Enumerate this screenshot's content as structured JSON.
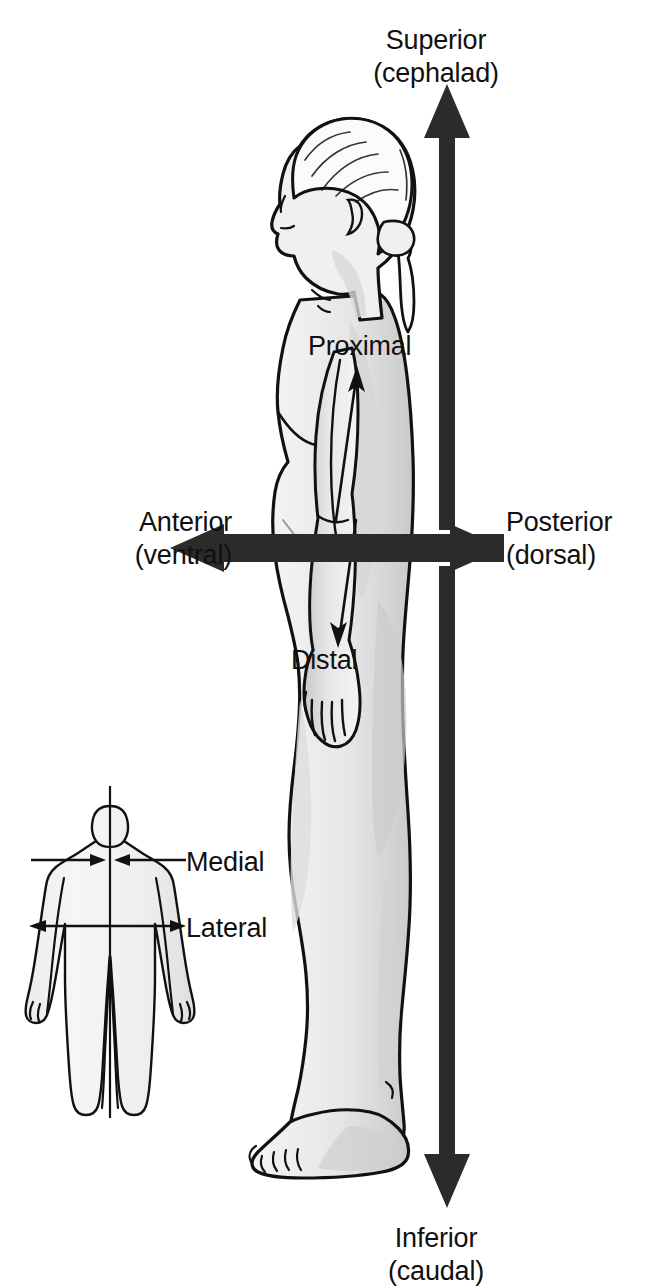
{
  "figure": {
    "title_visible": false,
    "background_color": "#ffffff",
    "ink_color": "#101010",
    "body_fill": "#f1f1f1",
    "body_shade": "#cfcfcf",
    "outline_color": "#111111"
  },
  "labels": {
    "superior": {
      "primary": "Superior",
      "secondary": "(cephalad)"
    },
    "inferior": {
      "primary": "Inferior",
      "secondary": "(caudal)"
    },
    "anterior": {
      "primary": "Anterior",
      "secondary": "(ventral)"
    },
    "posterior": {
      "primary": "Posterior",
      "secondary": "(dorsal)"
    },
    "proximal": {
      "primary": "Proximal"
    },
    "distal": {
      "primary": "Distal"
    },
    "medial": {
      "primary": "Medial"
    },
    "lateral": {
      "primary": "Lateral"
    }
  },
  "arrows": {
    "vertical_axis": {
      "name": "superior-inferior-axis",
      "direction": "bidirectional-vertical",
      "style": "thick-solid-block",
      "color": "#2b2b2b",
      "top_tip_y": 84,
      "bottom_tip_y": 1208,
      "shaft_x": 437,
      "shaft_width": 21
    },
    "horizontal_axis": {
      "name": "anterior-posterior-axis",
      "direction": "bidirectional-horizontal",
      "style": "thick-solid-block",
      "color": "#2b2b2b",
      "left_tip_x": 170,
      "right_tip_x": 504,
      "shaft_y": 541,
      "shaft_height": 19
    },
    "proximal_arrow": {
      "name": "proximal-arrow",
      "direction": "up-along-arm",
      "style": "thin-line",
      "tip": [
        357,
        368
      ],
      "tail": [
        335,
        518
      ]
    },
    "distal_arrow": {
      "name": "distal-arrow",
      "direction": "down-along-arm",
      "style": "thin-line",
      "tip": [
        338,
        645
      ],
      "tail": [
        356,
        520
      ]
    },
    "medial_arrows": {
      "name": "medial-arrow-pair",
      "direction": "inward-toward-midline",
      "style": "thin-line",
      "y": 860,
      "left_tail_x": 31,
      "left_tip_x": 105,
      "right_tail_x": 185,
      "right_tip_x": 113,
      "leader_to_label_x": 186
    },
    "lateral_arrows": {
      "name": "lateral-arrow-pair",
      "direction": "outward-from-midline",
      "style": "thin-line",
      "y": 926,
      "left_tip_x": 29,
      "right_tip_x": 185,
      "leader_to_label_x": 186
    }
  },
  "figures": {
    "main": {
      "name": "lateral-view-female-body",
      "view": "lateral (side) profile, facing left",
      "features": [
        "head with ponytail",
        "arm with elbow",
        "hand at hip",
        "leg",
        "foot with toes"
      ]
    },
    "inset": {
      "name": "anterior-view-body-inset",
      "view": "anterior (front) view",
      "midline": {
        "x": 110,
        "top_y": 786,
        "bottom_y": 1115
      }
    }
  }
}
